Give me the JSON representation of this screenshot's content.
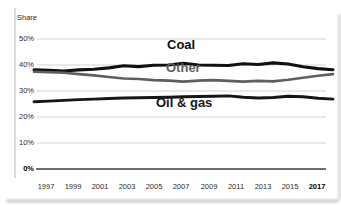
{
  "chart_data": {
    "type": "line",
    "title": "",
    "ylabel": "Share",
    "xlabel": "",
    "x": [
      1997,
      1998,
      1999,
      2000,
      2001,
      2002,
      2003,
      2004,
      2005,
      2006,
      2007,
      2008,
      2009,
      2010,
      2011,
      2012,
      2013,
      2014,
      2015,
      2016,
      2017
    ],
    "xticklabels": [
      "1997",
      "1999",
      "2001",
      "2003",
      "2005",
      "2007",
      "2009",
      "2011",
      "2013",
      "2015",
      "2017"
    ],
    "yticks": [
      "50%",
      "40%",
      "30%",
      "20%",
      "10%",
      "0%"
    ],
    "ylim": [
      0,
      52
    ],
    "grid": "horizontal",
    "legend_position": "inline-labels",
    "series": [
      {
        "name": "Coal",
        "color": "#111111",
        "values": [
          38.1,
          38.0,
          37.7,
          38.1,
          38.4,
          38.9,
          39.7,
          39.4,
          39.9,
          40.0,
          40.7,
          40.0,
          39.9,
          39.8,
          40.5,
          40.2,
          40.8,
          40.4,
          39.3,
          38.6,
          38.2
        ]
      },
      {
        "name": "Other",
        "color": "#5f5f5f",
        "values": [
          37.4,
          37.2,
          37.0,
          36.5,
          36.0,
          35.4,
          34.8,
          34.6,
          34.2,
          34.0,
          33.6,
          34.0,
          34.2,
          33.9,
          33.6,
          33.9,
          33.7,
          34.3,
          35.1,
          35.9,
          36.5
        ]
      },
      {
        "name": "Oil & gas",
        "color": "#161616",
        "values": [
          25.9,
          26.1,
          26.4,
          26.7,
          26.9,
          27.1,
          27.3,
          27.4,
          27.5,
          27.6,
          27.8,
          27.9,
          28.0,
          28.1,
          27.6,
          27.3,
          27.5,
          28.0,
          27.8,
          27.2,
          26.9
        ]
      }
    ]
  }
}
